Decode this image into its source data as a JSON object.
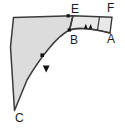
{
  "figure": {
    "type": "geometric-diagram",
    "title": "",
    "background_color": "#ffffff",
    "stroke_color": "#3a3a3a",
    "main_region_fill": "#dcdcdc",
    "band_region_fill": "#e8e8e8",
    "marker_color": "#111111",
    "labels": [
      {
        "id": "E",
        "text": "E",
        "x": 75,
        "y": 9
      },
      {
        "id": "F",
        "text": "F",
        "x": 111,
        "y": 8
      },
      {
        "id": "B",
        "text": "B",
        "x": 74,
        "y": 40
      },
      {
        "id": "A",
        "text": "A",
        "x": 111,
        "y": 39
      },
      {
        "id": "C",
        "text": "C",
        "x": 19,
        "y": 118
      }
    ],
    "vertices": {
      "corner_top_left": {
        "x": 13,
        "y": 17
      },
      "E": {
        "x": 73,
        "y": 16
      },
      "F": {
        "x": 112,
        "y": 17
      },
      "A": {
        "x": 110,
        "y": 33
      },
      "B": {
        "x": 69,
        "y": 30
      },
      "C": {
        "x": 14,
        "y": 111
      }
    },
    "point_dots": [
      {
        "name": "dot-on-top-edge",
        "x": 68,
        "y": 16
      },
      {
        "name": "dot-at-B",
        "x": 69,
        "y": 30
      },
      {
        "name": "dot-interior",
        "x": 42,
        "y": 55
      }
    ],
    "tick_markers": [
      {
        "name": "arc-tick-left",
        "x": 86,
        "y": 28
      },
      {
        "name": "arc-tick-right",
        "x": 92,
        "y": 28
      }
    ],
    "arrow_marker": {
      "name": "direction-arrow",
      "x": 46,
      "y": 69
    }
  }
}
